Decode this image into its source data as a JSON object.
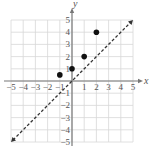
{
  "chart_data": {
    "type": "scatter",
    "title": "",
    "xlabel": "x",
    "ylabel": "y",
    "xlim": [
      -5,
      5
    ],
    "ylim": [
      -5,
      5
    ],
    "grid": true,
    "x_ticks": [
      "−5",
      "−4",
      "−3",
      "−2",
      "−1",
      "1",
      "2",
      "3",
      "4",
      "5"
    ],
    "y_ticks": [
      "5",
      "4",
      "3",
      "2",
      "1",
      "−1",
      "−2",
      "−3",
      "−4",
      "−5"
    ],
    "series": [
      {
        "name": "points",
        "type": "scatter",
        "points": [
          {
            "x": -1,
            "y": 0.5
          },
          {
            "x": 0,
            "y": 1
          },
          {
            "x": 1,
            "y": 2
          },
          {
            "x": 2,
            "y": 4
          }
        ]
      },
      {
        "name": "y = x",
        "type": "line",
        "style": "dashed",
        "arrows": "both",
        "points": [
          {
            "x": -5,
            "y": -5
          },
          {
            "x": 5,
            "y": 5
          }
        ]
      }
    ],
    "colors": {
      "grid": "#d8d8d8",
      "axis": "#777777",
      "points": "#111111",
      "line": "#333333"
    }
  }
}
